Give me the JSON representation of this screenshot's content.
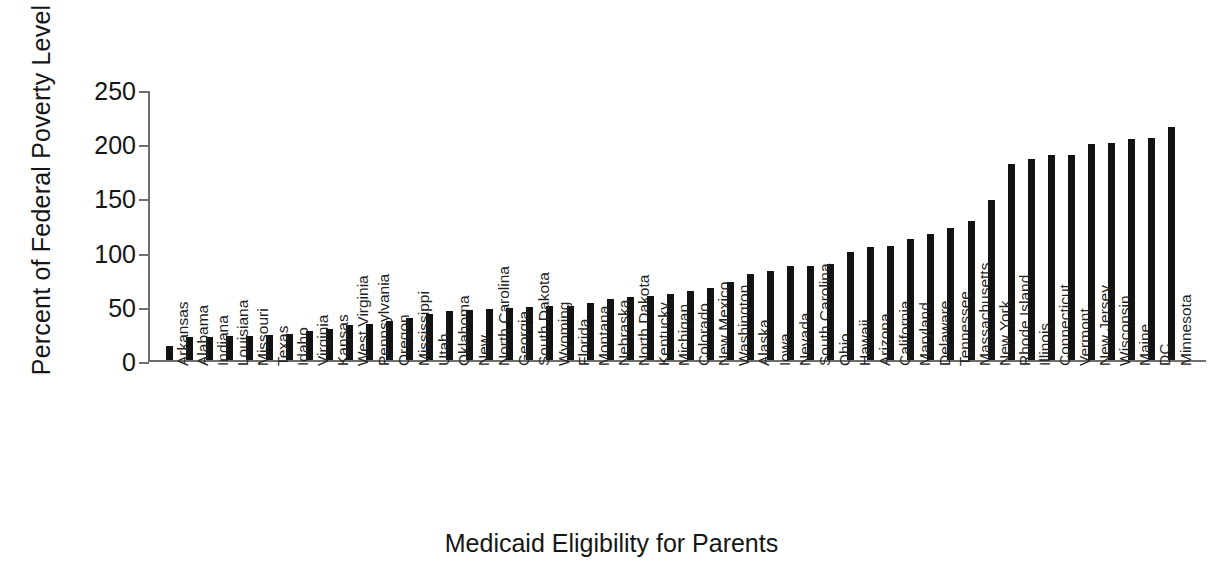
{
  "chart_data": {
    "type": "bar",
    "title": "",
    "xlabel": "Medicaid Eligibility for Parents",
    "ylabel": "Percent of Federal Poverty Level",
    "ylim": [
      0,
      250
    ],
    "yticks": [
      0,
      50,
      100,
      150,
      200,
      250
    ],
    "ytick_labels": [
      "0",
      "50",
      "100",
      "150",
      "200",
      "250"
    ],
    "grid": false,
    "legend": false,
    "bar_color": "#131313",
    "axis_color": "#6e6e6e",
    "categories": [
      "Arkansas",
      "Alabama",
      "Indiana",
      "Louisiana",
      "Missouri",
      "Texas",
      "Idaho",
      "Virginia",
      "Kansas",
      "West Virginia",
      "Pennsylvania",
      "Oregon",
      "Mississippi",
      "Utah",
      "Oklahoma",
      "New",
      "North Carolina",
      "Georgia",
      "South Dakota",
      "Wyoming",
      "Florida",
      "Montana",
      "Nebraska",
      "North Dakota",
      "Kentucky",
      "Michigan",
      "Colorado",
      "New Mexico",
      "Washington",
      "Alaska",
      "Iowa",
      "Nevada",
      "South Carolina",
      "Ohio",
      "Hawaii",
      "Arizona",
      "California",
      "Maryland",
      "Delaware",
      "Tennessee",
      "Massachusetts",
      "New York",
      "Rhode Island",
      "Illinois",
      "Connecticut",
      "Vermont",
      "New Jersey",
      "Wisconsin",
      "Maine",
      "DC",
      "Minnesota"
    ],
    "values": [
      13,
      21,
      21,
      22,
      22,
      23,
      24,
      27,
      29,
      32,
      33,
      36,
      39,
      42,
      45,
      46,
      47,
      48,
      49,
      50,
      50,
      53,
      56,
      58,
      59,
      61,
      64,
      66,
      72,
      79,
      82,
      87,
      87,
      89,
      100,
      104,
      105,
      112,
      116,
      122,
      128,
      148,
      181,
      185,
      189,
      189,
      199,
      200,
      204,
      205,
      215
    ]
  }
}
